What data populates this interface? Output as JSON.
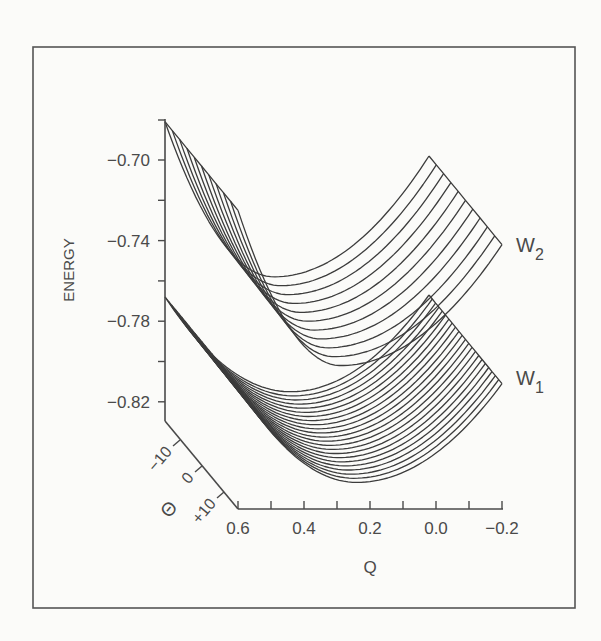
{
  "figure": {
    "surface_labels": {
      "upper": {
        "main": "W",
        "sub": "2"
      },
      "lower": {
        "main": "W",
        "sub": "1"
      }
    }
  },
  "chart_data": {
    "type": "surface-wireframe",
    "title": "",
    "ylabel": "ENERGY",
    "xlabel": "Q",
    "zlabel": "Θ",
    "y_ticks": [
      "-0.70",
      "-0.74",
      "-0.78",
      "-0.82"
    ],
    "y_minor_ticks": [
      -0.72,
      -0.76,
      -0.8
    ],
    "ylim": [
      -0.836,
      -0.68
    ],
    "x_ticks": [
      "0.6",
      "0.4",
      "0.2",
      "0.0",
      "-0.2"
    ],
    "xlim": [
      0.6,
      -0.2
    ],
    "z_ticks": [
      "-10",
      "0",
      "+10"
    ],
    "zlim": [
      -15,
      15
    ],
    "grid": false,
    "series": [
      {
        "name": "W2",
        "description": "upper adiabatic surface, family of curves vs Q at fixed Θ",
        "curves": 11,
        "back_curve_energy": {
          "Q=0.6": -0.681,
          "Q_min": 0.27,
          "E_min": -0.758,
          "Q=-0.2": -0.698
        },
        "front_curve_energy": {
          "Q=0.6": -0.725,
          "E_min": -0.802,
          "Q=-0.2": -0.742
        }
      },
      {
        "name": "W1",
        "description": "lower adiabatic surface, family of curves vs Q at fixed Θ",
        "curves": 23,
        "back_curve_energy": {
          "Q=0.6": -0.768,
          "Q_min": 0.22,
          "E_min": -0.815,
          "Q=-0.2": -0.767
        },
        "front_curve_energy": {
          "Q=0.6": -0.812,
          "E_min": -0.86,
          "Q=-0.2": -0.811
        }
      }
    ]
  }
}
